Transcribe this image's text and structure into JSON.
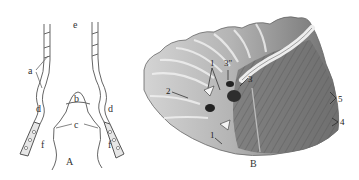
{
  "panel_a": {
    "caption": "A",
    "labels": {
      "a": "a",
      "b": "b",
      "c": "c",
      "d_left": "d",
      "d_right": "d",
      "e": "e",
      "f_left": "f",
      "f_right": "f"
    }
  },
  "panel_b": {
    "caption": "B",
    "labels": {
      "l1_top": "1",
      "l1_bottom": "1",
      "l2": "2",
      "l3p": "3\"",
      "l3": "3",
      "l4": "4",
      "l5": "5"
    }
  },
  "colors": {
    "line": "#555555",
    "tissue_light": "#c9c9c9",
    "tissue_mid": "#9a9a9a",
    "tissue_dark": "#5e5e5e",
    "background": "#ffffff"
  }
}
